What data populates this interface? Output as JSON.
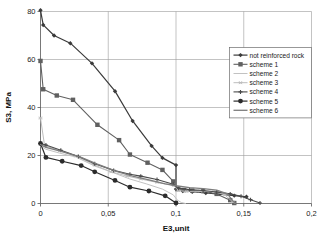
{
  "chart_data": {
    "type": "line",
    "title": "",
    "xlabel": "E3,unit",
    "ylabel": "S3, MPa",
    "xlim": [
      0,
      0.2
    ],
    "ylim": [
      0,
      80
    ],
    "xticks": [
      0,
      0.05,
      0.1,
      0.15,
      0.2
    ],
    "xticklabels": [
      "0",
      "0,05",
      "0,1",
      "0,15",
      "0,2"
    ],
    "yticks": [
      0,
      20,
      40,
      60,
      80
    ],
    "yticklabels": [
      "0",
      "20",
      "40",
      "60",
      "80"
    ],
    "grid": true,
    "legend_position": "upper right",
    "series": [
      {
        "name": "not reinforced rock",
        "color": "#3a3a3a",
        "width": 1.2,
        "marker": "diamond",
        "marker_size": 2.2,
        "points": [
          [
            0.0,
            80.5
          ],
          [
            0.002,
            74.4
          ],
          [
            0.01,
            70.0
          ],
          [
            0.022,
            66.8
          ],
          [
            0.038,
            58.4
          ],
          [
            0.055,
            46.8
          ],
          [
            0.068,
            34.4
          ],
          [
            0.082,
            24.0
          ],
          [
            0.09,
            19.0
          ],
          [
            0.1,
            16.0
          ],
          [
            0.1,
            6.0
          ],
          [
            0.105,
            5.2
          ],
          [
            0.112,
            4.9
          ],
          [
            0.122,
            4.4
          ],
          [
            0.132,
            3.9
          ],
          [
            0.143,
            3.3
          ],
          [
            0.152,
            2.8
          ]
        ]
      },
      {
        "name": "scheme 1",
        "color": "#606060",
        "width": 1.1,
        "marker": "square",
        "marker_size": 2.2,
        "points": [
          [
            0.0,
            59.4
          ],
          [
            0.002,
            47.6
          ],
          [
            0.012,
            45.0
          ],
          [
            0.024,
            43.2
          ],
          [
            0.042,
            32.8
          ],
          [
            0.058,
            26.4
          ],
          [
            0.066,
            20.4
          ],
          [
            0.079,
            17.0
          ],
          [
            0.09,
            14.0
          ],
          [
            0.098,
            9.2
          ],
          [
            0.101,
            6.0
          ],
          [
            0.106,
            5.6
          ],
          [
            0.112,
            5.4
          ],
          [
            0.12,
            5.2
          ],
          [
            0.13,
            4.0
          ],
          [
            0.14,
            1.4
          ],
          [
            0.143,
            0.2
          ]
        ]
      },
      {
        "name": "scheme 2",
        "color": "#c2c2c2",
        "width": 1.0,
        "marker": "none",
        "marker_size": 0,
        "points": [
          [
            0.0,
            24.0
          ],
          [
            0.004,
            22.6
          ],
          [
            0.014,
            21.0
          ],
          [
            0.026,
            19.4
          ],
          [
            0.04,
            15.6
          ],
          [
            0.054,
            12.8
          ],
          [
            0.066,
            10.2
          ],
          [
            0.078,
            8.2
          ],
          [
            0.09,
            6.0
          ],
          [
            0.098,
            3.6
          ],
          [
            0.101,
            1.4
          ],
          [
            0.104,
            0.4
          ],
          [
            0.107,
            0.0
          ]
        ]
      },
      {
        "name": "scheme 3",
        "color": "#bdbdbd",
        "width": 1.0,
        "marker": "star",
        "marker_size": 2.0,
        "points": [
          [
            0.0,
            35.6
          ],
          [
            0.003,
            24.2
          ],
          [
            0.014,
            22.0
          ],
          [
            0.026,
            19.8
          ],
          [
            0.04,
            16.0
          ],
          [
            0.052,
            13.2
          ],
          [
            0.064,
            11.4
          ],
          [
            0.074,
            10.2
          ],
          [
            0.086,
            8.8
          ],
          [
            0.098,
            7.6
          ],
          [
            0.102,
            5.4
          ],
          [
            0.108,
            5.0
          ],
          [
            0.118,
            5.2
          ],
          [
            0.128,
            5.0
          ],
          [
            0.136,
            3.6
          ],
          [
            0.142,
            0.6
          ]
        ]
      },
      {
        "name": "scheme 4",
        "color": "#4a4a4a",
        "width": 1.1,
        "marker": "cross",
        "marker_size": 2.0,
        "points": [
          [
            0.0,
            25.0
          ],
          [
            0.004,
            24.4
          ],
          [
            0.015,
            22.2
          ],
          [
            0.028,
            19.6
          ],
          [
            0.04,
            16.6
          ],
          [
            0.054,
            13.8
          ],
          [
            0.066,
            12.2
          ],
          [
            0.074,
            11.4
          ],
          [
            0.086,
            10.0
          ],
          [
            0.098,
            8.0
          ],
          [
            0.102,
            6.4
          ],
          [
            0.11,
            5.8
          ],
          [
            0.12,
            5.4
          ],
          [
            0.13,
            4.8
          ],
          [
            0.14,
            4.0
          ],
          [
            0.148,
            3.0
          ],
          [
            0.155,
            1.6
          ],
          [
            0.162,
            0.2
          ]
        ]
      },
      {
        "name": "scheme 5",
        "color": "#2b2b2b",
        "width": 1.2,
        "marker": "circle",
        "marker_size": 2.4,
        "points": [
          [
            0.0,
            25.0
          ],
          [
            0.004,
            19.2
          ],
          [
            0.016,
            17.6
          ],
          [
            0.03,
            15.8
          ],
          [
            0.04,
            13.2
          ],
          [
            0.055,
            9.6
          ],
          [
            0.066,
            6.8
          ],
          [
            0.08,
            5.2
          ],
          [
            0.092,
            3.2
          ],
          [
            0.1,
            0.2
          ]
        ]
      },
      {
        "name": "scheme 6",
        "color": "#7d7d7d",
        "width": 1.3,
        "marker": "none",
        "marker_size": 0,
        "points": [
          [
            0.0,
            24.6
          ],
          [
            0.004,
            23.4
          ],
          [
            0.016,
            21.6
          ],
          [
            0.03,
            19.2
          ],
          [
            0.042,
            16.4
          ],
          [
            0.056,
            13.4
          ],
          [
            0.068,
            11.4
          ],
          [
            0.08,
            9.8
          ],
          [
            0.092,
            8.2
          ],
          [
            0.1,
            7.4
          ],
          [
            0.11,
            6.6
          ],
          [
            0.12,
            6.2
          ],
          [
            0.13,
            5.6
          ],
          [
            0.138,
            4.0
          ],
          [
            0.142,
            1.0
          ],
          [
            0.144,
            0.0
          ]
        ]
      }
    ]
  },
  "legend": {
    "entries": [
      {
        "label": "not reinforced rock"
      },
      {
        "label": "scheme 1"
      },
      {
        "label": "scheme 2"
      },
      {
        "label": "scheme 3"
      },
      {
        "label": "scheme 4"
      },
      {
        "label": "scheme 5"
      },
      {
        "label": "scheme 6"
      }
    ]
  }
}
